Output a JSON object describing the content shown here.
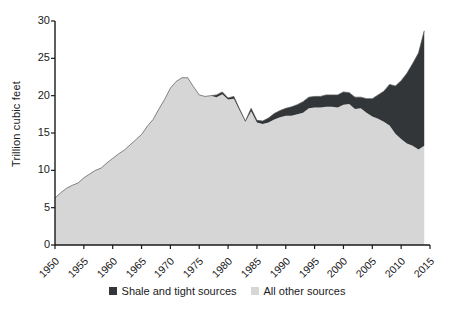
{
  "chart_data": {
    "type": "area",
    "title": "",
    "subtitle": "",
    "xlabel": "",
    "ylabel": "Trillion cubic feet",
    "xlim": [
      1950,
      2015
    ],
    "ylim": [
      0,
      30
    ],
    "grid": false,
    "stacked": true,
    "legend_position": "bottom",
    "ytick_labels": [
      "0",
      "5",
      "10",
      "15",
      "20",
      "25",
      "30"
    ],
    "ytick_values": [
      0,
      5,
      10,
      15,
      20,
      25,
      30
    ],
    "xtick_labels": [
      "1950",
      "1955",
      "1960",
      "1965",
      "1970",
      "1975",
      "1980",
      "1985",
      "1990",
      "1995",
      "2000",
      "2005",
      "2010",
      "2015"
    ],
    "xtick_values": [
      1950,
      1955,
      1960,
      1965,
      1970,
      1975,
      1980,
      1985,
      1990,
      1995,
      2000,
      2005,
      2010,
      2015
    ],
    "x": [
      1950,
      1951,
      1952,
      1953,
      1954,
      1955,
      1956,
      1957,
      1958,
      1959,
      1960,
      1961,
      1962,
      1963,
      1964,
      1965,
      1966,
      1967,
      1968,
      1969,
      1970,
      1971,
      1972,
      1973,
      1974,
      1975,
      1976,
      1977,
      1978,
      1979,
      1980,
      1981,
      1982,
      1983,
      1984,
      1985,
      1986,
      1987,
      1988,
      1989,
      1990,
      1991,
      1992,
      1993,
      1994,
      1995,
      1996,
      1997,
      1998,
      1999,
      2000,
      2001,
      2002,
      2003,
      2004,
      2005,
      2006,
      2007,
      2008,
      2009,
      2010,
      2011,
      2012,
      2013,
      2014
    ],
    "series": [
      {
        "name": "All other sources",
        "color": "#d6d6d6",
        "values": [
          6.3,
          7.0,
          7.6,
          8.0,
          8.3,
          9.0,
          9.5,
          10.0,
          10.3,
          11.0,
          11.6,
          12.2,
          12.7,
          13.4,
          14.1,
          14.8,
          15.9,
          16.8,
          18.2,
          19.5,
          21.0,
          21.9,
          22.4,
          22.4,
          21.2,
          20.1,
          19.9,
          20.0,
          19.8,
          20.2,
          19.5,
          19.6,
          18.0,
          16.5,
          17.9,
          16.4,
          16.2,
          16.4,
          16.8,
          17.1,
          17.3,
          17.3,
          17.5,
          17.7,
          18.3,
          18.4,
          18.4,
          18.5,
          18.5,
          18.4,
          18.8,
          18.9,
          18.2,
          18.3,
          17.7,
          17.2,
          16.9,
          16.5,
          16.0,
          14.9,
          14.2,
          13.6,
          13.3,
          12.8,
          13.3
        ]
      },
      {
        "name": "Shale and tight sources",
        "color": "#333638",
        "values": [
          0.0,
          0.0,
          0.0,
          0.0,
          0.0,
          0.0,
          0.0,
          0.0,
          0.0,
          0.0,
          0.0,
          0.0,
          0.0,
          0.0,
          0.0,
          0.0,
          0.0,
          0.0,
          0.0,
          0.0,
          0.0,
          0.0,
          0.0,
          0.0,
          0.0,
          0.0,
          0.0,
          0.0,
          0.3,
          0.3,
          0.2,
          0.3,
          0.2,
          0.1,
          0.4,
          0.3,
          0.4,
          0.6,
          0.8,
          0.9,
          1.0,
          1.2,
          1.3,
          1.5,
          1.5,
          1.5,
          1.5,
          1.6,
          1.6,
          1.7,
          1.7,
          1.5,
          1.6,
          1.5,
          1.9,
          2.4,
          3.2,
          4.1,
          5.5,
          6.4,
          7.8,
          9.4,
          11.0,
          12.9,
          15.4
        ]
      }
    ],
    "totals": [
      6.3,
      7.0,
      7.6,
      8.0,
      8.3,
      9.0,
      9.5,
      10.0,
      10.3,
      11.0,
      11.6,
      12.2,
      12.7,
      13.4,
      14.1,
      14.8,
      15.9,
      16.8,
      18.2,
      19.5,
      21.0,
      21.9,
      22.4,
      22.4,
      21.2,
      20.1,
      19.9,
      20.0,
      20.1,
      20.5,
      19.7,
      19.9,
      18.2,
      16.6,
      18.3,
      16.7,
      16.6,
      17.0,
      17.6,
      18.0,
      18.3,
      18.5,
      18.8,
      19.2,
      19.8,
      19.9,
      19.9,
      20.1,
      20.1,
      20.1,
      20.5,
      20.4,
      19.8,
      19.8,
      19.6,
      19.6,
      20.1,
      20.6,
      21.5,
      21.3,
      22.0,
      23.0,
      24.3,
      25.7,
      28.7
    ],
    "annotations": []
  },
  "legend": {
    "items": [
      {
        "label": "Shale and tight sources",
        "color": "#333638"
      },
      {
        "label": "All other sources",
        "color": "#d6d6d6"
      }
    ]
  }
}
